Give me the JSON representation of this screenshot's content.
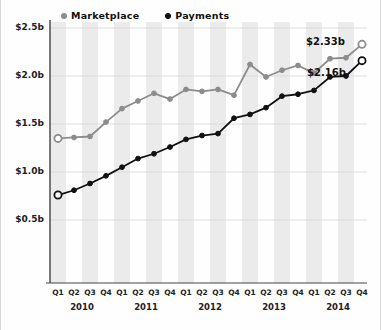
{
  "legend": {
    "items": [
      {
        "label": "Marketplace",
        "color": "#8c8c8c",
        "icon": "circle-marker-gray"
      },
      {
        "label": "Payments",
        "color": "#111111",
        "icon": "circle-marker-black"
      }
    ]
  },
  "annotations": {
    "marketplace_end": "$2.33b",
    "payments_end": "$2.16b"
  },
  "axis": {
    "y_ticks": [
      "$0.5b",
      "$1.0b",
      "$1.5b",
      "$2.0b",
      "$2.5b"
    ],
    "x_quarters": [
      "Q1",
      "Q2",
      "Q3",
      "Q4",
      "Q1",
      "Q2",
      "Q3",
      "Q4",
      "Q1",
      "Q2",
      "Q3",
      "Q4",
      "Q1",
      "Q2",
      "Q3",
      "Q4",
      "Q1",
      "Q2",
      "Q3",
      "Q4"
    ],
    "x_years": [
      "2010",
      "2011",
      "2012",
      "2013",
      "2014"
    ]
  },
  "chart_data": {
    "type": "line",
    "title": "",
    "xlabel": "",
    "ylabel": "",
    "ylim": [
      0.0,
      2.6
    ],
    "ytick_values": [
      0.5,
      1.0,
      1.5,
      2.0,
      2.5
    ],
    "ytick_labels": [
      "$0.5b",
      "$1.0b",
      "$1.5b",
      "$2.0b",
      "$2.5b"
    ],
    "grid": true,
    "grid_axis": "y",
    "banding": "alternating-vertical-quarter-bands",
    "legend_position": "top-left",
    "units": "USD billions",
    "categories": [
      "Q1 2010",
      "Q2 2010",
      "Q3 2010",
      "Q4 2010",
      "Q1 2011",
      "Q2 2011",
      "Q3 2011",
      "Q4 2011",
      "Q1 2012",
      "Q2 2012",
      "Q3 2012",
      "Q4 2012",
      "Q1 2013",
      "Q2 2013",
      "Q3 2013",
      "Q4 2013",
      "Q1 2014",
      "Q2 2014",
      "Q3 2014",
      "Q4 2014"
    ],
    "series": [
      {
        "name": "Marketplace",
        "color": "#8c8c8c",
        "marker": "circle",
        "first_point_open": true,
        "last_point_open": true,
        "end_label": "$2.33b",
        "values": [
          1.35,
          1.36,
          1.37,
          1.52,
          1.66,
          1.74,
          1.82,
          1.76,
          1.86,
          1.84,
          1.86,
          1.8,
          2.12,
          1.99,
          2.06,
          2.11,
          2.03,
          2.18,
          2.19,
          2.33
        ]
      },
      {
        "name": "Payments",
        "color": "#111111",
        "marker": "circle",
        "first_point_open": true,
        "last_point_open": true,
        "end_label": "$2.16b",
        "values": [
          0.76,
          0.81,
          0.88,
          0.96,
          1.05,
          1.14,
          1.19,
          1.26,
          1.34,
          1.38,
          1.4,
          1.56,
          1.6,
          1.67,
          1.79,
          1.81,
          1.85,
          1.99,
          2.0,
          2.16
        ]
      }
    ]
  }
}
